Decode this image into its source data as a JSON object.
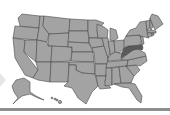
{
  "map": {
    "region": "United States",
    "base_fill": "#a3a3a3",
    "border_color": "#4a4a4a",
    "highlight_fill": "#5a5a5a",
    "highlighted_states": [
      "West Virginia",
      "Maryland",
      "Delaware"
    ],
    "insets": [
      "Alaska",
      "Hawaii"
    ]
  },
  "footer_bar": {
    "color": "#8e8e8e"
  },
  "nav": {
    "prev_arrow_icon": "chevron-left-icon"
  }
}
